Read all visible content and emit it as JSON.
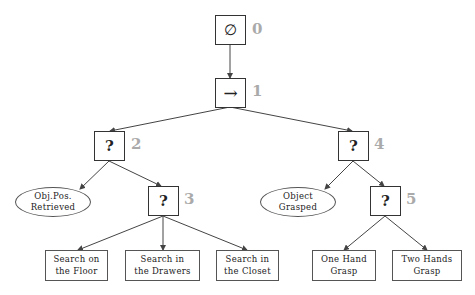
{
  "diagram": {
    "type": "behavior-tree",
    "edge_color": "#444444",
    "index_color": "#aaaaaa",
    "nodes": [
      {
        "id": 0,
        "kind": "root",
        "symbol": "∅",
        "index_label": "0"
      },
      {
        "id": 1,
        "kind": "sequence",
        "symbol": "→",
        "index_label": "1"
      },
      {
        "id": 2,
        "kind": "fallback",
        "symbol": "?",
        "index_label": "2"
      },
      {
        "id": 3,
        "kind": "fallback",
        "symbol": "?",
        "index_label": "3"
      },
      {
        "id": 4,
        "kind": "fallback",
        "symbol": "?",
        "index_label": "4"
      },
      {
        "id": 5,
        "kind": "fallback",
        "symbol": "?",
        "index_label": "5"
      }
    ],
    "conditions": [
      {
        "parent": 2,
        "line1": "Obj.Pos.",
        "line2": "Retrieved"
      },
      {
        "parent": 4,
        "line1": "Object",
        "line2": "Grasped"
      }
    ],
    "actions": [
      {
        "parent": 3,
        "line1": "Search on",
        "line2": "the Floor"
      },
      {
        "parent": 3,
        "line1": "Search in",
        "line2": "the Drawers"
      },
      {
        "parent": 3,
        "line1": "Search in",
        "line2": "the Closet"
      },
      {
        "parent": 5,
        "line1": "One Hand",
        "line2": "Grasp"
      },
      {
        "parent": 5,
        "line1": "Two Hands",
        "line2": "Grasp"
      }
    ],
    "edges": [
      [
        "0",
        "1"
      ],
      [
        "1",
        "2"
      ],
      [
        "1",
        "4"
      ],
      [
        "2",
        "cond-obj-pos"
      ],
      [
        "2",
        "3"
      ],
      [
        "3",
        "floor"
      ],
      [
        "3",
        "drawers"
      ],
      [
        "3",
        "closet"
      ],
      [
        "4",
        "cond-grasped"
      ],
      [
        "4",
        "5"
      ],
      [
        "5",
        "one-hand"
      ],
      [
        "5",
        "two-hands"
      ]
    ]
  }
}
